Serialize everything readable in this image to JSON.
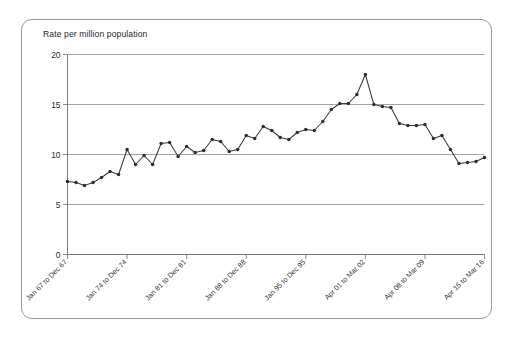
{
  "chart_data": {
    "type": "line",
    "title": "Rate per million population",
    "xlabel": "",
    "ylabel": "Rate per million population",
    "ylim": [
      0,
      20
    ],
    "yticks": [
      0,
      5,
      10,
      15,
      20
    ],
    "grid": true,
    "legend": false,
    "xtick_labels": [
      "Jan 67 to Dec 67",
      "Jan 74 to Dec 74",
      "Jan 81 to Dec 81",
      "Jan 88 to Dec 88",
      "Jan 95 to Dec 95",
      "Apr 01 to Mar 02",
      "Apr 08 to Mar 09",
      "Apr 15 to Mar 16"
    ],
    "xtick_indices": [
      0,
      7,
      14,
      21,
      28,
      35,
      42,
      49
    ],
    "categories": [
      "Jan 67 to Dec 67",
      "Jan 68 to Dec 68",
      "Jan 69 to Dec 69",
      "Jan 70 to Dec 70",
      "Jan 71 to Dec 71",
      "Jan 72 to Dec 72",
      "Jan 73 to Dec 73",
      "Jan 74 to Dec 74",
      "Jan 75 to Dec 75",
      "Jan 76 to Dec 76",
      "Jan 77 to Dec 77",
      "Jan 78 to Dec 78",
      "Jan 79 to Dec 79",
      "Jan 80 to Dec 80",
      "Jan 81 to Dec 81",
      "Jan 82 to Dec 82",
      "Jan 83 to Dec 83",
      "Jan 84 to Dec 84",
      "Jan 85 to Dec 85",
      "Jan 86 to Dec 86",
      "Jan 87 to Dec 87",
      "Jan 88 to Dec 88",
      "Jan 89 to Dec 89",
      "Jan 90 to Dec 90",
      "Jan 91 to Dec 91",
      "Jan 92 to Dec 92",
      "Jan 93 to Dec 93",
      "Jan 94 to Dec 94",
      "Jan 95 to Dec 95",
      "Jan 96 to Dec 96",
      "Jan 97 to Dec 97",
      "Jan 98 to Dec 98",
      "Jan 99 to Dec 99",
      "Jan 00 to Dec 00",
      "Apr 00 to Mar 01",
      "Apr 01 to Mar 02",
      "Apr 02 to Mar 03",
      "Apr 03 to Mar 04",
      "Apr 04 to Mar 05",
      "Apr 05 to Mar 06",
      "Apr 06 to Mar 07",
      "Apr 07 to Mar 08",
      "Apr 08 to Mar 09",
      "Apr 09 to Mar 10",
      "Apr 10 to Mar 11",
      "Apr 11 to Mar 12",
      "Apr 12 to Mar 13",
      "Apr 13 to Mar 14",
      "Apr 14 to Mar 15",
      "Apr 15 to Mar 16"
    ],
    "values": [
      7.3,
      7.2,
      6.9,
      7.2,
      7.7,
      8.3,
      8.0,
      10.5,
      9.0,
      9.9,
      9.0,
      11.1,
      11.2,
      9.8,
      10.8,
      10.2,
      10.4,
      11.5,
      11.3,
      10.3,
      10.5,
      11.9,
      11.6,
      12.8,
      12.4,
      11.7,
      11.5,
      12.2,
      12.5,
      12.4,
      13.3,
      14.5,
      15.1,
      15.1,
      16.0,
      18.0,
      15.0,
      14.8,
      14.7,
      13.1,
      12.9,
      12.9,
      13.0,
      11.6,
      11.9,
      10.5,
      9.1,
      9.2,
      9.3,
      9.7
    ],
    "line_color": "#3b3b3b",
    "marker_color": "#2e2e2e"
  }
}
